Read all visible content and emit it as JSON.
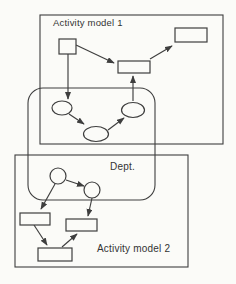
{
  "diagram": {
    "kind": "overlapping-activity-models-diagram",
    "labels": {
      "model1": "Activity model 1",
      "dept": "Dept.",
      "model2": "Activity model 2"
    },
    "colors": {
      "background": "#fbfbf8",
      "line": "#3e3e3e",
      "text": "#333333"
    },
    "containers": [
      {
        "id": "model1",
        "shape": "rectangle",
        "label": "Activity model 1"
      },
      {
        "id": "dept",
        "shape": "rounded-rectangle",
        "label": "Dept."
      },
      {
        "id": "model2",
        "shape": "rectangle",
        "label": "Activity model 2"
      }
    ],
    "nodes": [
      {
        "id": "m1-box-small",
        "type": "box",
        "container": "model1"
      },
      {
        "id": "m1-box-center",
        "type": "box",
        "container": "model1"
      },
      {
        "id": "m1-box-right",
        "type": "box",
        "container": "model1"
      },
      {
        "id": "ellipse-left",
        "type": "ellipse",
        "container": "dept+model1"
      },
      {
        "id": "ellipse-bottom",
        "type": "ellipse",
        "container": "dept+model1"
      },
      {
        "id": "ellipse-right",
        "type": "ellipse",
        "container": "dept+model1"
      },
      {
        "id": "circle-left",
        "type": "circle",
        "container": "dept+model2"
      },
      {
        "id": "circle-right",
        "type": "circle",
        "container": "dept+model2"
      },
      {
        "id": "m2-box-left",
        "type": "box",
        "container": "model2"
      },
      {
        "id": "m2-box-right",
        "type": "box",
        "container": "model2"
      },
      {
        "id": "m2-box-bottom",
        "type": "box",
        "container": "model2"
      }
    ],
    "edges": [
      "m1-box-small -> ellipse-left",
      "m1-box-small -> m1-box-center",
      "ellipse-right -> m1-box-center",
      "m1-box-center -> m1-box-right",
      "ellipse-left -> ellipse-bottom",
      "ellipse-bottom -> ellipse-right",
      "circle-left -> circle-right",
      "circle-left -> m2-box-left",
      "circle-right -> m2-box-right",
      "m2-box-left -> m2-box-bottom",
      "m2-box-bottom -> m2-box-right"
    ]
  }
}
